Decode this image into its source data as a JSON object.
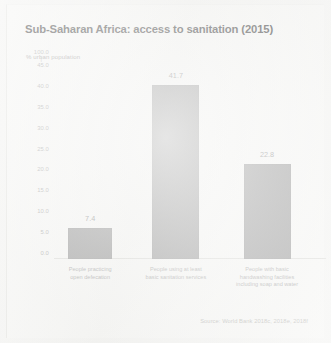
{
  "chart_data": {
    "type": "bar",
    "title": "Sub-Saharan Africa: access to sanitation (2015)",
    "subtitle": "% urban population",
    "xlabel": "",
    "ylabel": "% urban population",
    "ylim": [
      0.0,
      45.0
    ],
    "grid": false,
    "legend": null,
    "categories": [
      "People practicing open defecation",
      "People using at least basic sanitation services",
      "People with basic handwashing facilities including soap and water"
    ],
    "category_lines": [
      [
        "People practicing",
        "open defecation"
      ],
      [
        "People using at least",
        "basic sanitation services"
      ],
      [
        "People with basic",
        "handwashing facilities",
        "including soap and water"
      ]
    ],
    "values": [
      7.4,
      41.7,
      22.8
    ],
    "value_labels": [
      "7.4",
      "41.7",
      "22.8"
    ],
    "ytick_labels": [
      "45.0",
      "40.0",
      "35.0",
      "30.0",
      "25.0",
      "20.0",
      "15.0",
      "10.0",
      "5.0",
      "0.0"
    ],
    "ytick_values": [
      45.0,
      40.0,
      35.0,
      30.0,
      25.0,
      20.0,
      15.0,
      10.0,
      5.0,
      0.0
    ],
    "ytick_anomaly_label": "100.0",
    "ytick_anomaly_mark": "|",
    "annotations": [
      "Source: World Bank 2018c, 2018e, 2018f"
    ],
    "bar_color": "#8d8d8d"
  },
  "source_note": "Source: World Bank 2018c, 2018e, 2018f",
  "colors": {
    "background": "#f4f4f2",
    "sheet": "#f7f7f5",
    "bar": "#8d8d8d",
    "title": "#2c2c2c",
    "muted_text": "#9a9a9a",
    "source_text": "#b0b0ac"
  }
}
